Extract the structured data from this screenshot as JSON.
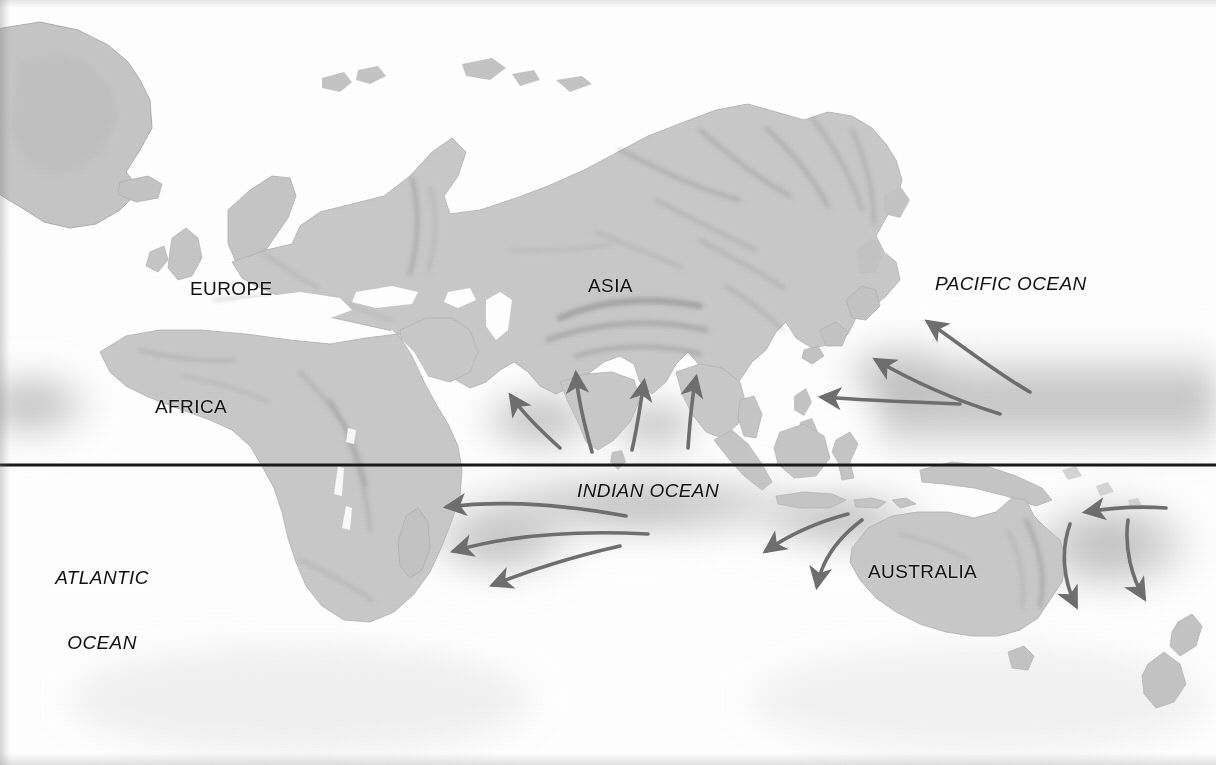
{
  "map": {
    "title": "Monsoon and ocean current map of the Eastern Hemisphere",
    "projection_note": "equatorial cylindrical, Eastern Hemisphere centered",
    "background_color": "#ffffff",
    "land_color": "#c9c9c9",
    "land_shade_color": "#9a9a9a",
    "ocean_warm_pool_color": "#bcbcbc",
    "arrow_color": "#6f6f6f",
    "label_color": "#111111",
    "equator": {
      "name": "equator-line",
      "color": "#1a1a1a",
      "y": 465,
      "thickness": 3
    },
    "continent_labels": [
      {
        "id": "europe",
        "text": "EUROPE",
        "x": 190,
        "y": 278
      },
      {
        "id": "asia",
        "text": "ASIA",
        "x": 588,
        "y": 275
      },
      {
        "id": "africa",
        "text": "AFRICA",
        "x": 155,
        "y": 396
      },
      {
        "id": "australia",
        "text": "AUSTRALIA",
        "x": 868,
        "y": 561
      }
    ],
    "ocean_labels": [
      {
        "id": "pacific-ocean",
        "text": "PACIFIC OCEAN",
        "lines": [
          "PACIFIC OCEAN"
        ],
        "x": 935,
        "y": 273
      },
      {
        "id": "indian-ocean",
        "text": "INDIAN OCEAN",
        "lines": [
          "INDIAN OCEAN"
        ],
        "x": 577,
        "y": 480
      },
      {
        "id": "atlantic-ocean",
        "text": "ATLANTIC OCEAN",
        "lines": [
          "ATLANTIC",
          "OCEAN"
        ],
        "x": 42,
        "y": 523
      }
    ],
    "flow_arrows": [
      {
        "id": "arrow-arabian-sea-ne",
        "group": "monsoon-inflow",
        "direction": "northeast",
        "tip": [
          508,
          393
        ]
      },
      {
        "id": "arrow-arabian-sea-n",
        "group": "monsoon-inflow",
        "direction": "north",
        "tip": [
          575,
          371
        ]
      },
      {
        "id": "arrow-bay-of-bengal-n",
        "group": "monsoon-inflow",
        "direction": "north",
        "tip": [
          643,
          379
        ]
      },
      {
        "id": "arrow-south-china-sea-n",
        "group": "monsoon-inflow",
        "direction": "north",
        "tip": [
          696,
          375
        ]
      },
      {
        "id": "arrow-pacific-nw-upper",
        "group": "pacific-inflow",
        "direction": "northwest",
        "tip": [
          925,
          319
        ]
      },
      {
        "id": "arrow-pacific-nw-mid",
        "group": "pacific-inflow",
        "direction": "northwest",
        "tip": [
          872,
          357
        ]
      },
      {
        "id": "arrow-pacific-w-lower",
        "group": "pacific-inflow",
        "direction": "west",
        "tip": [
          818,
          396
        ]
      },
      {
        "id": "arrow-indian-w-upper",
        "group": "indian-outflow",
        "direction": "west",
        "tip": [
          443,
          507
        ]
      },
      {
        "id": "arrow-indian-w-mid",
        "group": "indian-outflow",
        "direction": "west",
        "tip": [
          450,
          551
        ]
      },
      {
        "id": "arrow-indian-sw-lower",
        "group": "indian-outflow",
        "direction": "southwest",
        "tip": [
          489,
          586
        ]
      },
      {
        "id": "arrow-west-australia-sw",
        "group": "australia-flank",
        "direction": "southwest",
        "tip": [
          762,
          553
        ]
      },
      {
        "id": "arrow-west-australia-s",
        "group": "australia-flank",
        "direction": "south",
        "tip": [
          816,
          589
        ]
      },
      {
        "id": "arrow-coral-sea-w",
        "group": "australia-flank",
        "direction": "west",
        "tip": [
          1081,
          513
        ]
      },
      {
        "id": "arrow-tasman-s-inner",
        "group": "australia-flank",
        "direction": "south",
        "tip": [
          1078,
          609
        ]
      },
      {
        "id": "arrow-tasman-s-outer",
        "group": "australia-flank",
        "direction": "south",
        "tip": [
          1145,
          601
        ]
      }
    ],
    "landmasses": [
      "greenland",
      "northern-europe",
      "scandinavia",
      "iceland",
      "british-isles",
      "eurasia",
      "africa",
      "arabia",
      "india",
      "southeast-asia",
      "indonesia",
      "new-guinea",
      "japan",
      "philippines",
      "australia",
      "new-zealand",
      "madagascar",
      "sri-lanka"
    ]
  }
}
